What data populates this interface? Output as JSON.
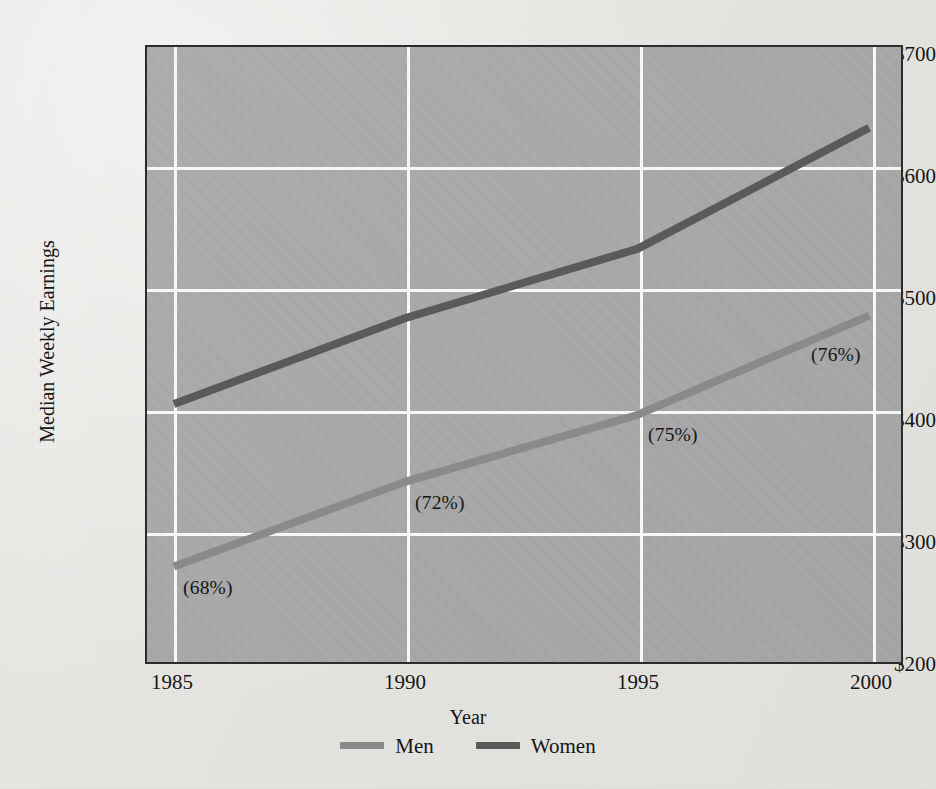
{
  "chart_data": {
    "type": "line",
    "title": "",
    "xlabel": "Year",
    "ylabel": "Median Weekly Earnings",
    "x": [
      1985,
      1990,
      1995,
      2000
    ],
    "xtick_labels": [
      "1985",
      "1990",
      "1995",
      "2000"
    ],
    "ytick_labels": [
      "$200",
      "$300",
      "$400",
      "$500",
      "$600",
      "$700"
    ],
    "ytick_values": [
      200,
      300,
      400,
      500,
      600,
      700
    ],
    "xlim": [
      1985,
      2000
    ],
    "ylim": [
      200,
      700
    ],
    "grid": true,
    "grid_color": "#f7f7f5",
    "plot_background": "#a9a9a9",
    "legend_position": "bottom-center",
    "series": [
      {
        "name": "Men",
        "color": "#8a8a8a",
        "values": [
          278,
          348,
          403,
          485
        ]
      },
      {
        "name": "Women",
        "color": "#5a5a5a",
        "values": [
          412,
          483,
          540,
          640
        ]
      }
    ],
    "annotations": [
      {
        "text": "(68%)",
        "x": 1985,
        "y": 255
      },
      {
        "text": "(72%)",
        "x": 1990,
        "y": 325
      },
      {
        "text": "(75%)",
        "x": 1995,
        "y": 382
      },
      {
        "text": "(76%)",
        "x": 2000,
        "y": 465
      }
    ]
  },
  "axes": {
    "y_title": "Median Weekly Earnings",
    "x_title": "Year",
    "y_ticks": [
      "$700",
      "$600",
      "$500",
      "$400",
      "$300",
      "$200"
    ],
    "x_ticks": [
      "1985",
      "1990",
      "1995",
      "2000"
    ]
  },
  "annotations": {
    "pct_1985": "(68%)",
    "pct_1990": "(72%)",
    "pct_1995": "(75%)",
    "pct_2000": "(76%)"
  },
  "legend": {
    "items": [
      {
        "label": "Men",
        "color": "#8a8a8a"
      },
      {
        "label": "Women",
        "color": "#5a5a5a"
      }
    ]
  }
}
